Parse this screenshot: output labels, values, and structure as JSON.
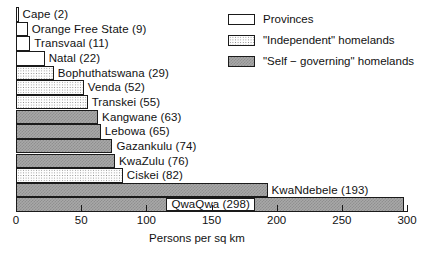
{
  "chart_data": {
    "type": "bar",
    "orientation": "horizontal",
    "title": "",
    "xlabel": "Persons per sq km",
    "ylabel": "",
    "xlim": [
      0,
      300
    ],
    "xticks": [
      0,
      50,
      100,
      150,
      200,
      250,
      300
    ],
    "xtick_labels": [
      "0",
      "50",
      "100",
      "150",
      "200",
      "250",
      "300"
    ],
    "grid": false,
    "legend_position": "top-right",
    "categories": [
      "Cape",
      "Orange Free State",
      "Transvaal",
      "Natal",
      "Bophuthatswana",
      "Venda",
      "Transkei",
      "Kangwane",
      "Lebowa",
      "Gazankulu",
      "KwaZulu",
      "Ciskei",
      "KwaNdebele",
      "QwaQwa"
    ],
    "values": [
      2,
      9,
      11,
      22,
      29,
      52,
      55,
      63,
      65,
      74,
      76,
      82,
      193,
      298
    ],
    "bars": [
      {
        "label": "Cape (2)",
        "name": "Cape",
        "value": 2,
        "group": "province",
        "label_placement": "outside"
      },
      {
        "label": "Orange Free State (9)",
        "name": "Orange Free State",
        "value": 9,
        "group": "province",
        "label_placement": "outside"
      },
      {
        "label": "Transvaal (11)",
        "name": "Transvaal",
        "value": 11,
        "group": "province",
        "label_placement": "outside"
      },
      {
        "label": "Natal (22)",
        "name": "Natal",
        "value": 22,
        "group": "province",
        "label_placement": "outside"
      },
      {
        "label": "Bophuthatswana (29)",
        "name": "Bophuthatswana",
        "value": 29,
        "group": "independent",
        "label_placement": "outside"
      },
      {
        "label": "Venda (52)",
        "name": "Venda",
        "value": 52,
        "group": "independent",
        "label_placement": "outside"
      },
      {
        "label": "Transkei (55)",
        "name": "Transkei",
        "value": 55,
        "group": "independent",
        "label_placement": "outside"
      },
      {
        "label": "Kangwane (63)",
        "name": "Kangwane",
        "value": 63,
        "group": "selfgov",
        "label_placement": "outside"
      },
      {
        "label": "Lebowa (65)",
        "name": "Lebowa",
        "value": 65,
        "group": "selfgov",
        "label_placement": "outside"
      },
      {
        "label": "Gazankulu (74)",
        "name": "Gazankulu",
        "value": 74,
        "group": "selfgov",
        "label_placement": "outside"
      },
      {
        "label": "KwaZulu (76)",
        "name": "KwaZulu",
        "value": 76,
        "group": "selfgov",
        "label_placement": "outside"
      },
      {
        "label": "Ciskei (82)",
        "name": "Ciskei",
        "value": 82,
        "group": "independent",
        "label_placement": "outside"
      },
      {
        "label": "KwaNdebele (193)",
        "name": "KwaNdebele",
        "value": 193,
        "group": "selfgov",
        "label_placement": "outside"
      },
      {
        "label": "QwaQwa (298)",
        "name": "QwaQwa",
        "value": 298,
        "group": "selfgov",
        "label_placement": "inside"
      }
    ],
    "legend": [
      {
        "label": "Provinces",
        "group": "province"
      },
      {
        "label": "\"Independent\" homelands",
        "group": "independent"
      },
      {
        "label": "\"Self − governing\" homelands",
        "group": "selfgov"
      }
    ],
    "colors": {
      "outline": "#1a1a1a",
      "text": "#111111",
      "background": "#ffffff",
      "province_fill": "#ffffff",
      "independent_fill": "#fdfdfd",
      "selfgov_fill": "#a8a8a8"
    }
  }
}
